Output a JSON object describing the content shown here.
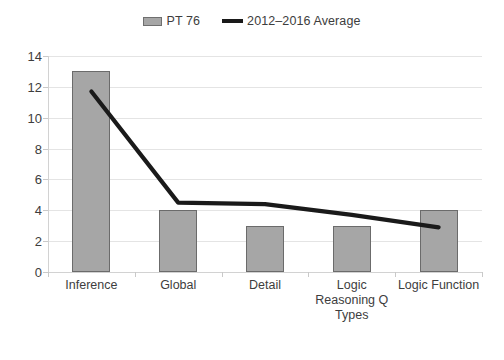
{
  "chart_data": {
    "type": "bar",
    "title": "",
    "xlabel": "",
    "ylabel": "",
    "categories": [
      "Inference",
      "Global",
      "Detail",
      "Logic Reasoning Q Types",
      "Logic Function"
    ],
    "ylim": [
      0,
      14
    ],
    "yticks": [
      0,
      2,
      4,
      6,
      8,
      10,
      12,
      14
    ],
    "grid": true,
    "legend_position": "top-center",
    "series": [
      {
        "name": "PT 76",
        "kind": "bar",
        "color": "#a6a6a6",
        "values": [
          13,
          4,
          3,
          3,
          4
        ]
      },
      {
        "name": "2012–2016 Average",
        "kind": "line",
        "color": "#1a1a1a",
        "values": [
          11.7,
          4.5,
          4.4,
          3.7,
          2.9
        ]
      }
    ]
  },
  "legend": {
    "entries": [
      {
        "label": "PT 76",
        "swatch": "bar-swatch-icon"
      },
      {
        "label": "2012–2016 Average",
        "swatch": "line-swatch-icon"
      }
    ]
  },
  "axis": {
    "y_labels": [
      "14",
      "12",
      "10",
      "8",
      "6",
      "4",
      "2",
      "0"
    ],
    "x_labels": [
      "Inference",
      "Global",
      "Detail",
      "Logic Reasoning Q Types",
      "Logic Function"
    ]
  }
}
